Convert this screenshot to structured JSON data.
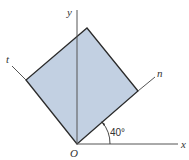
{
  "diagram": {
    "type": "coordinate-rotation",
    "labels": {
      "x_axis": "x",
      "y_axis": "y",
      "n_axis": "n",
      "t_axis": "t",
      "origin": "O",
      "angle": "40°"
    },
    "colors": {
      "fill": "#c2d0e2",
      "stroke": "#2b2b2b",
      "axis": "#555555"
    }
  }
}
